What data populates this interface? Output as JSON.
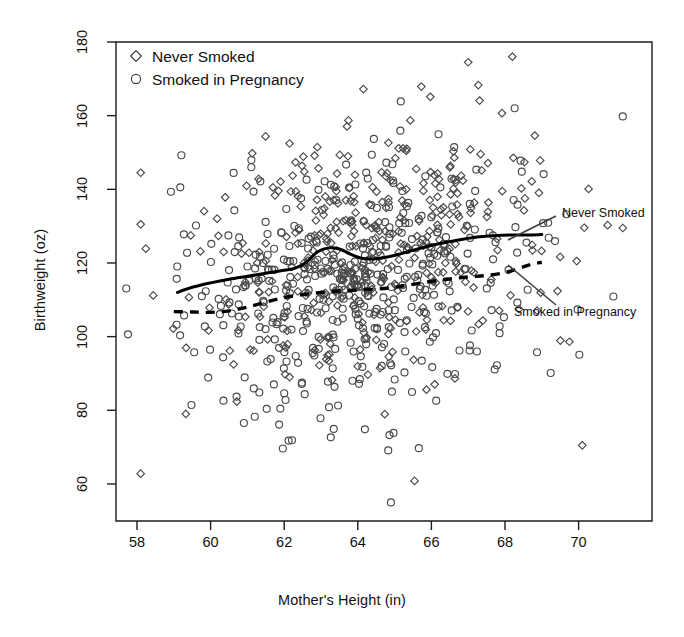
{
  "chart_data": {
    "type": "scatter",
    "title": "",
    "xlabel": "Mother's Height (in)",
    "ylabel": "Birthweight (oz)",
    "xlim": [
      57.4,
      71.5
    ],
    "ylim": [
      54,
      181
    ],
    "xticks": [
      58,
      60,
      62,
      64,
      66,
      68,
      70
    ],
    "xtick_labels": [
      "58",
      "60",
      "62",
      "64",
      "66",
      "68",
      "70"
    ],
    "yticks": [
      60,
      80,
      100,
      120,
      140,
      160,
      180
    ],
    "ytick_labels": [
      "60",
      "80",
      "100",
      "120",
      "140",
      "160",
      "180"
    ],
    "grid": false,
    "legend_position": "top-left",
    "legend": [
      {
        "label": "Never Smoked",
        "marker": "diamond",
        "color": "#3a3a3a"
      },
      {
        "label": "Smoked in Pregnancy",
        "marker": "circle",
        "color": "#3a3a3a"
      }
    ],
    "annotations": [
      {
        "text": "Never Smoked",
        "x_px": 562,
        "y_px": 213,
        "leader_from_x": 556,
        "leader_from_y": 216,
        "leader_to_x": 508,
        "leader_to_y": 240
      },
      {
        "text": "Smoked in Pregnancy",
        "x_px": 514,
        "y_px": 312,
        "leader_from_x": 556,
        "leader_from_y": 305,
        "leader_to_x": 508,
        "leader_to_y": 265
      }
    ],
    "series": [
      {
        "name": "Never Smoked",
        "marker": "diamond",
        "n_points": 390,
        "x_mean": 64.3,
        "x_sd": 2.35,
        "y_mean": 123.0,
        "y_sd": 17.5,
        "corr": 0.21,
        "seed": 20230411,
        "trend": {
          "style": "solid",
          "label": "Never Smoked",
          "linewidth": 3.0,
          "points": [
            [
              59.1,
              112.0
            ],
            [
              59.5,
              113.4
            ],
            [
              60.0,
              114.6
            ],
            [
              60.5,
              115.6
            ],
            [
              61.0,
              116.4
            ],
            [
              61.5,
              117.2
            ],
            [
              62.0,
              118.0
            ],
            [
              62.3,
              118.6
            ],
            [
              62.6,
              120.2
            ],
            [
              62.9,
              123.0
            ],
            [
              63.2,
              124.1
            ],
            [
              63.5,
              123.8
            ],
            [
              63.8,
              122.4
            ],
            [
              64.1,
              121.3
            ],
            [
              64.4,
              121.1
            ],
            [
              64.8,
              121.6
            ],
            [
              65.2,
              122.6
            ],
            [
              65.7,
              124.0
            ],
            [
              66.2,
              125.2
            ],
            [
              66.7,
              126.2
            ],
            [
              67.2,
              127.0
            ],
            [
              67.7,
              127.4
            ],
            [
              68.2,
              127.6
            ],
            [
              68.6,
              127.6
            ],
            [
              69.0,
              127.7
            ]
          ]
        }
      },
      {
        "name": "Smoked in Pregnancy",
        "marker": "circle",
        "n_points": 440,
        "x_mean": 64.0,
        "x_sd": 2.4,
        "y_mean": 114.0,
        "y_sd": 17.5,
        "corr": 0.19,
        "seed": 777013,
        "trend": {
          "style": "dashed",
          "label": "Smoked in Pregnancy",
          "linewidth": 3.4,
          "dash": "9 7",
          "points": [
            [
              59.0,
              106.8
            ],
            [
              59.5,
              106.7
            ],
            [
              60.0,
              106.6
            ],
            [
              60.5,
              107.0
            ],
            [
              61.0,
              108.0
            ],
            [
              61.5,
              109.4
            ],
            [
              62.0,
              110.6
            ],
            [
              62.5,
              111.4
            ],
            [
              63.0,
              112.0
            ],
            [
              63.5,
              112.4
            ],
            [
              64.0,
              112.6
            ],
            [
              64.5,
              112.9
            ],
            [
              65.0,
              113.4
            ],
            [
              65.5,
              114.2
            ],
            [
              66.0,
              115.0
            ],
            [
              66.5,
              115.7
            ],
            [
              67.0,
              116.2
            ],
            [
              67.5,
              116.6
            ],
            [
              68.0,
              117.4
            ],
            [
              68.4,
              118.6
            ],
            [
              68.7,
              119.6
            ],
            [
              69.0,
              120.2
            ]
          ]
        }
      }
    ],
    "outlier_points": [
      {
        "series": "Never Smoked",
        "x": 58.1,
        "y": 144.5
      },
      {
        "series": "Never Smoked",
        "x": 58.1,
        "y": 130.5
      },
      {
        "series": "Never Smoked",
        "x": 58.1,
        "y": 62.8
      },
      {
        "series": "Smoked in Pregnancy",
        "x": 64.9,
        "y": 55.0
      },
      {
        "series": "Never Smoked",
        "x": 68.2,
        "y": 176.0
      },
      {
        "series": "Never Smoked",
        "x": 67.0,
        "y": 174.5
      },
      {
        "series": "Smoked in Pregnancy",
        "x": 71.2,
        "y": 159.8
      },
      {
        "series": "Never Smoked",
        "x": 71.2,
        "y": 129.5
      },
      {
        "series": "Never Smoked",
        "x": 70.1,
        "y": 70.5
      }
    ]
  },
  "plot_geometry": {
    "left_px": 116,
    "right_px": 652,
    "top_px": 42,
    "bottom_px": 521,
    "x_at_58_px": 137,
    "px_per_inch": 36.8,
    "y_at_180_px": 42,
    "px_per_oz": 3.683
  },
  "axes": {
    "x_title": "Mother's Height (in)",
    "y_title": "Birthweight (oz)"
  },
  "legend": {
    "items": [
      {
        "label": "Never Smoked",
        "marker": "diamond"
      },
      {
        "label": "Smoked in Pregnancy",
        "marker": "circle"
      }
    ]
  },
  "annotations": {
    "never_smoked": "Never Smoked",
    "smoked_in_pregnancy": "Smoked in Pregnancy"
  },
  "colors": {
    "marker_stroke": "#4a4a4a",
    "axis": "#1c1c1c",
    "trend_solid": "#000000",
    "trend_dashed": "#000000",
    "text": "#111111",
    "background": "#ffffff"
  }
}
